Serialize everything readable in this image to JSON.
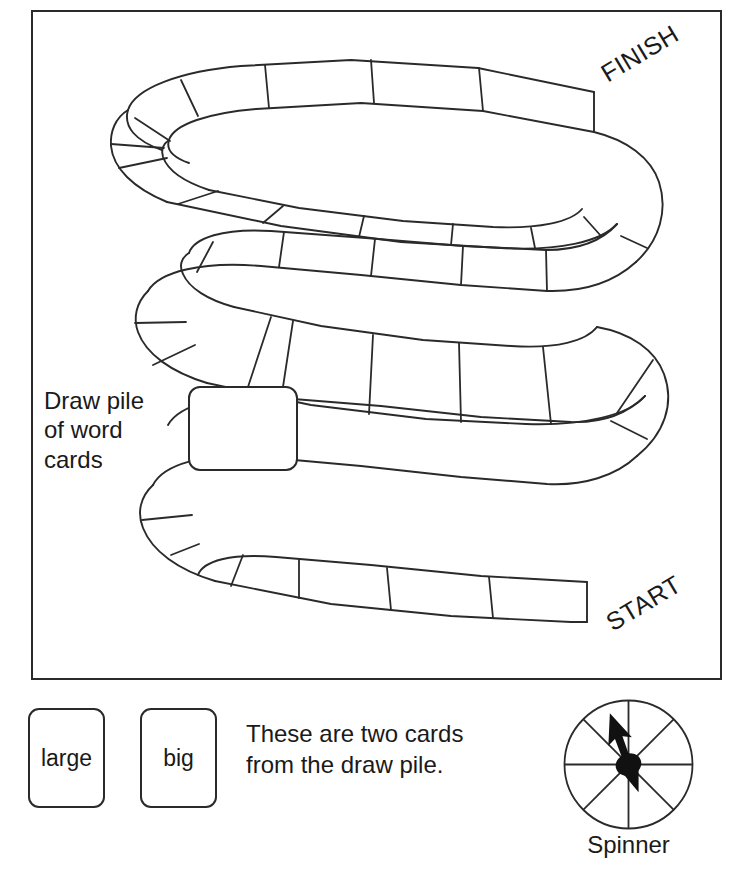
{
  "page": {
    "width": 738,
    "height": 882,
    "background_color": "#ffffff",
    "ink_color": "#2a2a2a"
  },
  "board": {
    "frame": {
      "x": 31,
      "y": 10,
      "width": 691,
      "height": 670
    },
    "start_label": "START",
    "finish_label": "FINISH",
    "track": {
      "shape": "serpentine",
      "rows": 3,
      "space_count": 30,
      "description": "Winding snake-like path of rectangular game spaces running from START at bottom right, left across the bottom row, U-turn at bottom left, right across the middle row, U-turn at middle right, left across the upper-middle row, U-turn at upper left, and right across the top row to FINISH."
    }
  },
  "draw_pile": {
    "caption": "Draw pile\nof word\ncards",
    "box": {
      "x": 188,
      "y": 386,
      "width": 110,
      "height": 85
    }
  },
  "bottom": {
    "cards": [
      {
        "label": "large"
      },
      {
        "label": "big"
      }
    ],
    "note": "These are two cards\nfrom the draw pile.",
    "spinner": {
      "caption": "Spinner",
      "sectors": 8,
      "needle_angle_deg": -20,
      "needle_direction": "up-left"
    }
  }
}
